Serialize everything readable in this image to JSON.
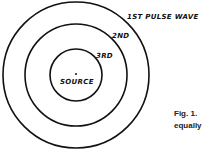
{
  "diagram": {
    "center": {
      "x": 76,
      "y": 75
    },
    "circles": [
      {
        "label": "1ST PULSE WAVE",
        "r": 73
      },
      {
        "label": "2ND",
        "r": 51
      },
      {
        "label": "3RD",
        "r": 26
      }
    ],
    "source_label": "SOURCE",
    "stroke_color": "#111111"
  },
  "caption": {
    "line1": "Fig. 1.",
    "line2": "equally"
  }
}
